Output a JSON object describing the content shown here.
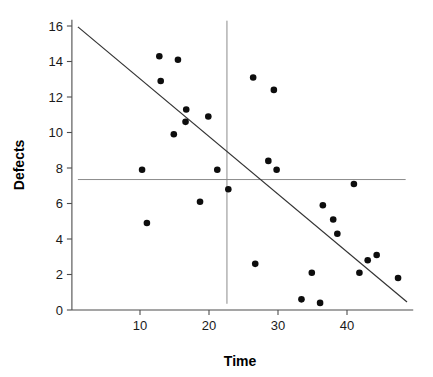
{
  "chart_data": {
    "type": "scatter",
    "title": "",
    "xlabel": "Time",
    "ylabel": "Defects",
    "xlim": [
      0,
      50
    ],
    "ylim": [
      0,
      16.5
    ],
    "xticks": [
      10,
      20,
      30,
      40
    ],
    "yticks": [
      0,
      2,
      4,
      6,
      8,
      10,
      12,
      14,
      16
    ],
    "grid": false,
    "legend": null,
    "points": [
      {
        "x": 10.3,
        "y": 7.9
      },
      {
        "x": 11.0,
        "y": 4.9
      },
      {
        "x": 12.8,
        "y": 14.3
      },
      {
        "x": 13.0,
        "y": 12.9
      },
      {
        "x": 14.9,
        "y": 9.9
      },
      {
        "x": 15.5,
        "y": 14.1
      },
      {
        "x": 16.7,
        "y": 11.3
      },
      {
        "x": 16.6,
        "y": 10.6
      },
      {
        "x": 18.7,
        "y": 6.1
      },
      {
        "x": 19.9,
        "y": 10.9
      },
      {
        "x": 21.2,
        "y": 7.9
      },
      {
        "x": 22.8,
        "y": 6.8
      },
      {
        "x": 26.4,
        "y": 13.1
      },
      {
        "x": 26.7,
        "y": 2.6
      },
      {
        "x": 28.6,
        "y": 8.4
      },
      {
        "x": 29.4,
        "y": 12.4
      },
      {
        "x": 29.8,
        "y": 7.9
      },
      {
        "x": 33.4,
        "y": 0.6
      },
      {
        "x": 34.9,
        "y": 2.1
      },
      {
        "x": 36.1,
        "y": 0.4
      },
      {
        "x": 36.5,
        "y": 5.9
      },
      {
        "x": 38.0,
        "y": 5.1
      },
      {
        "x": 38.6,
        "y": 4.3
      },
      {
        "x": 41.0,
        "y": 7.1
      },
      {
        "x": 41.8,
        "y": 2.1
      },
      {
        "x": 43.0,
        "y": 2.8
      },
      {
        "x": 44.3,
        "y": 3.1
      },
      {
        "x": 47.4,
        "y": 1.8
      }
    ],
    "fit_line": {
      "name": "regression-line",
      "x1": 1.0,
      "y1": 15.95,
      "x2": 48.7,
      "y2": 0.45
    },
    "reference_lines": [
      {
        "name": "mean-defects-line",
        "orientation": "horizontal",
        "value": 7.35,
        "x_from": 1.0,
        "x_to": 48.5
      },
      {
        "name": "mean-time-line",
        "orientation": "vertical",
        "value": 22.6,
        "y_from": 0.35,
        "y_to": 16.3
      }
    ]
  }
}
